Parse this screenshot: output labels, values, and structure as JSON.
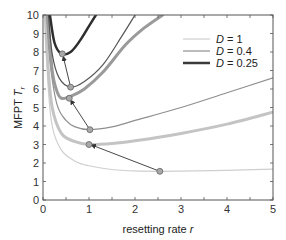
{
  "chart_data": {
    "type": "line",
    "title": "",
    "xlabel": "resetting rate r",
    "ylabel": "MFPT T_r",
    "xlim": [
      0,
      5
    ],
    "ylim": [
      0,
      10
    ],
    "xticks": [
      0,
      1,
      2,
      3,
      4,
      5
    ],
    "yticks": [
      0,
      1,
      2,
      3,
      4,
      5,
      6,
      7,
      8,
      9,
      10
    ],
    "grid": false,
    "legend_position": "upper right",
    "legend": [
      {
        "label": "D = 1",
        "color": "#cfcfcf"
      },
      {
        "label": "D = 0.4",
        "color": "#8f8f8f"
      },
      {
        "label": "D = 0.25",
        "color": "#3a3a3a"
      }
    ],
    "series": [
      {
        "name": "D = 1 (thin)",
        "color": "#cfcfcf",
        "width": 1.2,
        "x": [
          0.05,
          0.1,
          0.2,
          0.4,
          0.7,
          1.0,
          1.5,
          2.0,
          2.54,
          3.0,
          4.0,
          5.0
        ],
        "y": [
          10,
          6.6,
          4.0,
          2.7,
          2.1,
          1.85,
          1.65,
          1.57,
          1.55,
          1.56,
          1.6,
          1.67
        ]
      },
      {
        "name": "D = 1 (thick)",
        "color": "#c4c4c4",
        "width": 3,
        "x": [
          0.05,
          0.1,
          0.2,
          0.4,
          0.7,
          1.0,
          1.5,
          2.0,
          3.0,
          4.0,
          5.0
        ],
        "y": [
          10,
          7.5,
          5.0,
          3.6,
          3.15,
          3.0,
          3.05,
          3.2,
          3.6,
          4.1,
          4.75
        ]
      },
      {
        "name": "D = 0.4 (thin)",
        "color": "#8f8f8f",
        "width": 1.2,
        "x": [
          0.08,
          0.15,
          0.3,
          0.5,
          0.7,
          1.0,
          1.5,
          2.0,
          3.0,
          4.0,
          5.0
        ],
        "y": [
          10,
          7.5,
          5.2,
          4.3,
          3.95,
          3.8,
          3.95,
          4.3,
          5.0,
          5.8,
          6.6
        ]
      },
      {
        "name": "D = 0.4 (thick)",
        "color": "#9a9a9a",
        "width": 3,
        "x": [
          0.1,
          0.2,
          0.3,
          0.4,
          0.6,
          0.9,
          1.3,
          1.8,
          2.2,
          2.6
        ],
        "y": [
          10,
          7.0,
          5.9,
          5.5,
          5.6,
          6.0,
          6.9,
          8.4,
          9.3,
          10
        ]
      },
      {
        "name": "D = 0.25 (thin)",
        "color": "#555555",
        "width": 1.2,
        "x": [
          0.12,
          0.2,
          0.35,
          0.6,
          0.9,
          1.3,
          1.7,
          2.0
        ],
        "y": [
          10,
          7.9,
          6.6,
          6.1,
          6.4,
          7.3,
          8.8,
          10
        ]
      },
      {
        "name": "D = 0.25 (thick)",
        "color": "#2e2e2e",
        "width": 2.5,
        "x": [
          0.15,
          0.25,
          0.4,
          0.6,
          0.8,
          1.0,
          1.15
        ],
        "y": [
          10,
          8.5,
          7.9,
          8.0,
          8.6,
          9.4,
          10
        ]
      }
    ],
    "markers": [
      {
        "x": 0.42,
        "y": 7.9
      },
      {
        "x": 0.6,
        "y": 6.1
      },
      {
        "x": 0.57,
        "y": 5.5
      },
      {
        "x": 1.02,
        "y": 3.8
      },
      {
        "x": 1.0,
        "y": 3.0
      },
      {
        "x": 2.54,
        "y": 1.55
      }
    ],
    "annotations": [
      {
        "type": "arrow",
        "from": [
          2.54,
          1.55
        ],
        "to": [
          1.05,
          2.98
        ]
      },
      {
        "type": "arrow",
        "from": [
          1.02,
          3.8
        ],
        "to": [
          0.6,
          5.4
        ]
      },
      {
        "type": "arrow",
        "from": [
          0.6,
          6.1
        ],
        "to": [
          0.44,
          7.75
        ]
      }
    ]
  }
}
